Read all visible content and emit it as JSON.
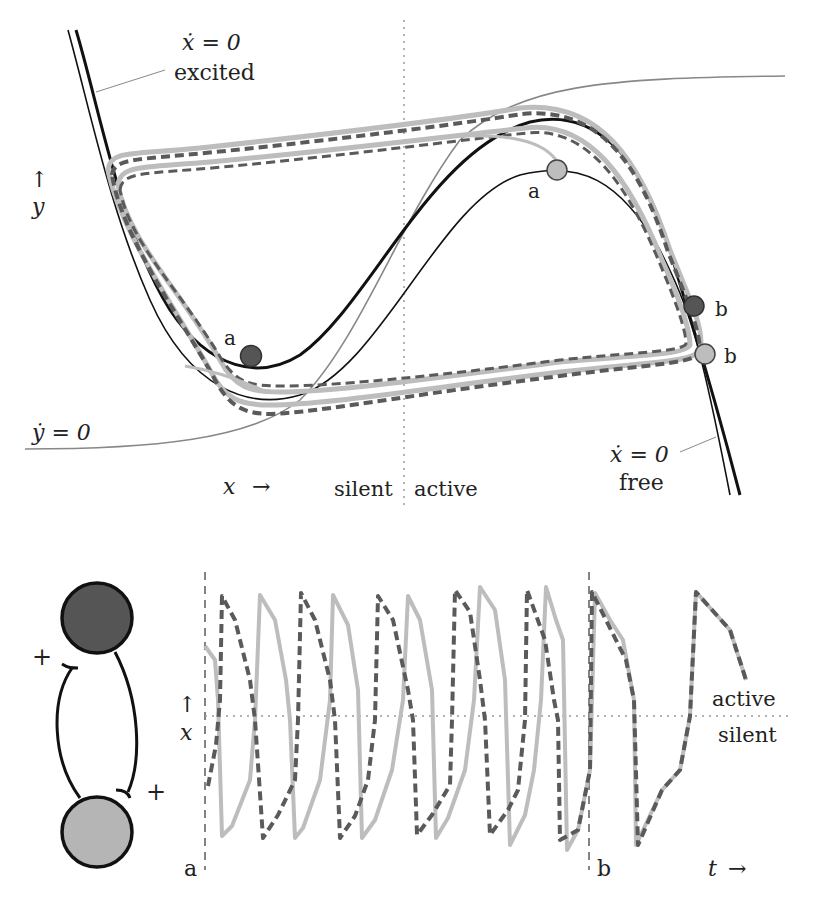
{
  "phase_plane": {
    "labels": {
      "xdot_excited_eq": "ẋ = 0",
      "xdot_excited_name": "excited",
      "xdot_free_eq": "ẋ = 0",
      "xdot_free_name": "free",
      "ydot_eq": "ẏ = 0",
      "y_axis_arrow": "↑",
      "y_axis": "y",
      "x_axis": "x",
      "x_axis_arrow": "→",
      "silent": "silent",
      "active": "active",
      "point_a_dark": "a",
      "point_a_light": "a",
      "point_b_dark": "b",
      "point_b_light": "b"
    },
    "colors": {
      "dark_cell": "#555555",
      "light_cell": "#bbbbbb",
      "nullcline_y": "#888888",
      "divider": "#999999"
    }
  },
  "network": {
    "plus_top": "+",
    "plus_bottom": "+",
    "top_cell_color": "#555555",
    "bottom_cell_color": "#b5b5b5"
  },
  "time_trace": {
    "y_axis_arrow": "↑",
    "y_axis": "x",
    "t_axis": "t",
    "t_axis_arrow": "→",
    "marker_a": "a",
    "marker_b": "b",
    "active": "active",
    "silent": "silent",
    "series": [
      {
        "name": "dark cell",
        "style": "dashed",
        "color": "#5a5a5a"
      },
      {
        "name": "light cell",
        "style": "solid",
        "color": "#bdbdbd"
      }
    ]
  }
}
